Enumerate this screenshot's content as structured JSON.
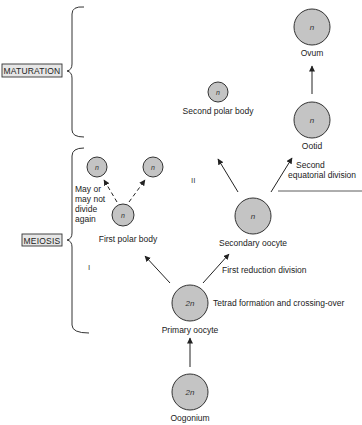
{
  "diagram": {
    "colors": {
      "cell_fill": "#c4c4c4",
      "cell_stroke": "#333333",
      "line": "#222222",
      "label_box_fill": "#e6e6e6"
    },
    "stage_labels": {
      "maturation": "MATURATION",
      "meiosis": "MEIOSIS"
    },
    "division_markers": {
      "first": "I",
      "second": "II"
    },
    "cells": {
      "ovum": {
        "ploidy": "n",
        "label": "Ovum"
      },
      "ootid": {
        "ploidy": "n",
        "label": "Ootid"
      },
      "second_polar_body": {
        "ploidy": "n",
        "label": "Second polar body"
      },
      "secondary_oocyte": {
        "ploidy": "n",
        "label": "Secondary oocyte"
      },
      "first_polar_body": {
        "ploidy": "n",
        "label": "First polar body"
      },
      "first_polar_body_daughter_left": {
        "ploidy": "n"
      },
      "first_polar_body_daughter_right": {
        "ploidy": "n"
      },
      "primary_oocyte": {
        "ploidy": "2n",
        "label": "Primary oocyte"
      },
      "oogonium": {
        "ploidy": "2n",
        "label": "Oogonium"
      }
    },
    "annotations": {
      "second_division_line1": "Second",
      "second_division_line2": "equatorial division",
      "first_division": "First reduction division",
      "tetrad": "Tetrad formation and crossing-over",
      "may_divide_line1": "May or",
      "may_divide_line2": "may not",
      "may_divide_line3": "divide",
      "may_divide_line4": "again"
    }
  }
}
